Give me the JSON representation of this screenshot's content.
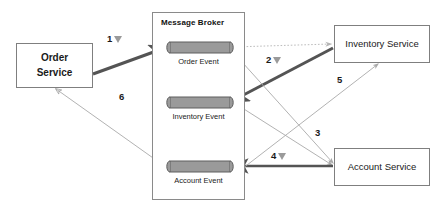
{
  "diagram": {
    "nodes": [
      {
        "id": "order-service",
        "label_line1": "Order",
        "label_line2": "Service"
      },
      {
        "id": "inventory-service",
        "label": "Inventory Service"
      },
      {
        "id": "account-service",
        "label": "Account Service"
      }
    ],
    "broker": {
      "title": "Message Broker",
      "queues": [
        {
          "id": "order-event",
          "label": "Order Event"
        },
        {
          "id": "inventory-event",
          "label": "Inventory Event"
        },
        {
          "id": "account-event",
          "label": "Account Event"
        }
      ]
    },
    "steps": [
      {
        "id": "step-1",
        "number": "1",
        "marker": "down-triangle-icon"
      },
      {
        "id": "step-2",
        "number": "2",
        "marker": "down-triangle-icon"
      },
      {
        "id": "step-3",
        "number": "3",
        "marker": "none"
      },
      {
        "id": "step-4",
        "number": "4",
        "marker": "down-triangle-icon"
      },
      {
        "id": "step-5",
        "number": "5",
        "marker": "none"
      },
      {
        "id": "step-6",
        "number": "6",
        "marker": "none"
      }
    ],
    "colors": {
      "node_border": "#7f7f7f",
      "broker_border": "#8a8a8a",
      "queue_fill": "#9a9a9a",
      "queue_stroke": "#5e5e5e",
      "thick_arrow": "#545454",
      "thin_arrow": "#aaaaaa",
      "dotted_arrow": "#bdbdbd",
      "text": "#1a1a1a",
      "background": "#ffffff"
    }
  }
}
